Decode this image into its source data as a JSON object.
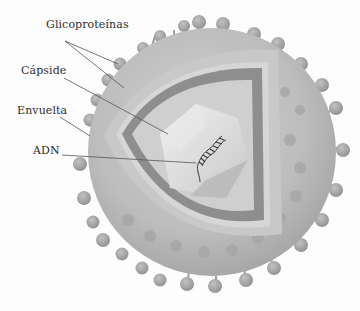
{
  "diagram": {
    "labels": [
      {
        "id": "glicoproteinas",
        "text": "Glicoproteínas"
      },
      {
        "id": "capside",
        "text": "Cápside"
      },
      {
        "id": "envuelta",
        "text": "Envuelta"
      },
      {
        "id": "adn",
        "text": "ADN"
      }
    ],
    "colors": {
      "background": "#fdfdfd",
      "envelope": "#b9b9b9",
      "envelope_shade": "#a9a9a9",
      "glycoprotein": "#a4a4a4",
      "capsid_outer": "#c9c9c9",
      "capsid_band": "#8f8f8f",
      "capsid_inner": "#d2d2d2",
      "core": "#e4e4e4",
      "core_shade": "#bdbdbd",
      "dna": "#3a3a3a",
      "leader": "#555555",
      "text": "#2e2e2e"
    }
  }
}
